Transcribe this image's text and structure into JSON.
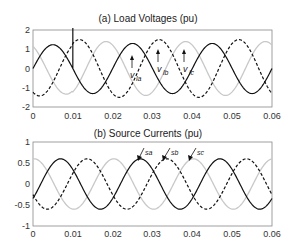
{
  "chart_data": [
    {
      "type": "line",
      "title": "(a) Load Voltages (pu)",
      "xlabel": "",
      "ylabel": "",
      "xlim": [
        0,
        0.06
      ],
      "ylim": [
        -2,
        2
      ],
      "xticks": [
        "0",
        "0.01",
        "0.02",
        "0.03",
        "0.04",
        "0.05",
        "0.06"
      ],
      "yticks": [
        "2",
        "1",
        "0",
        "-1",
        "-2"
      ],
      "grid": false,
      "frequency_hz": 50,
      "series": [
        {
          "name": "v_la",
          "style": "solid-black",
          "amplitude": 1.3,
          "phase_deg": 0,
          "note": "transient spike at t=0.01 reaching above 2"
        },
        {
          "name": "v_lb",
          "style": "dashed-black",
          "amplitude": 1.5,
          "phase_deg": -120
        },
        {
          "name": "v_lc",
          "style": "solid-lightgray",
          "amplitude": 1.4,
          "phase_deg": 120
        }
      ],
      "annotations": [
        {
          "label": "v",
          "sub": "la",
          "x": 0.026,
          "y": 1.3
        },
        {
          "label": "v",
          "sub": "lb",
          "x": 0.03,
          "y": 1.5
        },
        {
          "label": "v",
          "sub": "lc",
          "x": 0.037,
          "y": 1.4
        }
      ]
    },
    {
      "type": "line",
      "title": "(b) Source Currents (pu)",
      "xlabel": "",
      "ylabel": "",
      "xlim": [
        0,
        0.06
      ],
      "ylim": [
        -1,
        1
      ],
      "xticks": [
        "0",
        "0.01",
        "0.02",
        "0.03",
        "0.04",
        "0.05",
        "0.06"
      ],
      "yticks": [
        "1",
        "0.5",
        "0",
        "-0.5",
        "-1"
      ],
      "grid": false,
      "frequency_hz": 50,
      "series": [
        {
          "name": "i_sa",
          "style": "solid-black",
          "amplitude": 0.6,
          "phase_deg": -35
        },
        {
          "name": "i_sb",
          "style": "dashed-black",
          "amplitude": 0.6,
          "phase_deg": -155
        },
        {
          "name": "i_sc",
          "style": "solid-lightgray",
          "amplitude": 0.6,
          "phase_deg": 85
        }
      ],
      "annotations": [
        {
          "label": "i",
          "sub": "sa",
          "x": 0.026,
          "y": 0.5
        },
        {
          "label": "i",
          "sub": "sb",
          "x": 0.032,
          "y": 0.6
        },
        {
          "label": "i",
          "sub": "sc",
          "x": 0.039,
          "y": 0.6
        }
      ]
    }
  ],
  "labels": {
    "top_title": "(a) Load Voltages (pu)",
    "bottom_title": "(b) Source Currents (pu)",
    "v": "v",
    "la": "la",
    "lb": "lb",
    "lc": "lc",
    "sa": "sa",
    "sb": "sb",
    "sc": "sc",
    "x0": "0",
    "x1": "0.01",
    "x2": "0.02",
    "x3": "0.03",
    "x4": "0.04",
    "x5": "0.05",
    "x6": "0.06",
    "ty2": "2",
    "ty1": "1",
    "ty0": "0",
    "tym1": "-1",
    "tym2": "-2",
    "by1": "1",
    "by05": "0.5",
    "by0": "0",
    "bym05": "-0.5",
    "bym1": "-1"
  }
}
